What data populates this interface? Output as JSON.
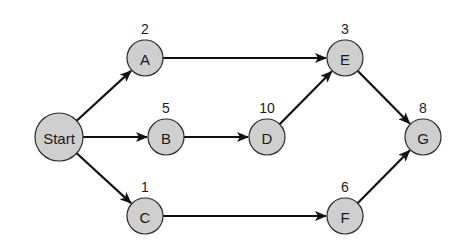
{
  "diagram": {
    "type": "activity-network",
    "colors": {
      "node_fill": "#cfcfcf",
      "node_stroke": "#2a2a2a",
      "edge": "#111111",
      "text": "#1a1a1a",
      "background": "#ffffff"
    },
    "nodes": [
      {
        "id": "Start",
        "label": "Start",
        "duration": "",
        "x": 59,
        "y": 137,
        "r": 24
      },
      {
        "id": "A",
        "label": "A",
        "duration": "2",
        "x": 145,
        "y": 58,
        "r": 18
      },
      {
        "id": "B",
        "label": "B",
        "duration": "5",
        "x": 166,
        "y": 137,
        "r": 18
      },
      {
        "id": "C",
        "label": "C",
        "duration": "1",
        "x": 145,
        "y": 216,
        "r": 18
      },
      {
        "id": "D",
        "label": "D",
        "duration": "10",
        "x": 267,
        "y": 137,
        "r": 18
      },
      {
        "id": "E",
        "label": "E",
        "duration": "3",
        "x": 345,
        "y": 58,
        "r": 18
      },
      {
        "id": "F",
        "label": "F",
        "duration": "6",
        "x": 345,
        "y": 216,
        "r": 18
      },
      {
        "id": "G",
        "label": "G",
        "duration": "8",
        "x": 423,
        "y": 137,
        "r": 18
      }
    ],
    "edges": [
      {
        "from": "Start",
        "to": "A"
      },
      {
        "from": "Start",
        "to": "B"
      },
      {
        "from": "Start",
        "to": "C"
      },
      {
        "from": "A",
        "to": "E"
      },
      {
        "from": "B",
        "to": "D"
      },
      {
        "from": "D",
        "to": "E"
      },
      {
        "from": "C",
        "to": "F"
      },
      {
        "from": "E",
        "to": "G"
      },
      {
        "from": "F",
        "to": "G"
      }
    ]
  }
}
